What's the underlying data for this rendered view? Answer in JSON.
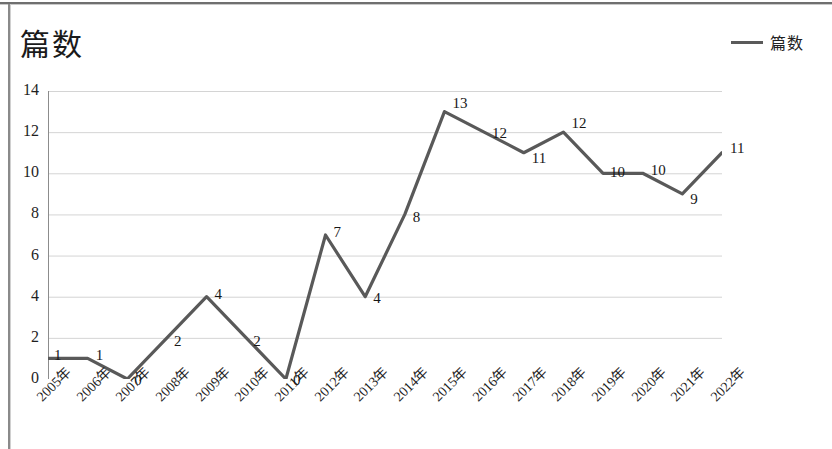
{
  "chart_data": {
    "type": "line",
    "title": "篇数",
    "xlabel": "",
    "ylabel": "",
    "ylim": [
      0,
      14
    ],
    "ytick_step": 2,
    "yticks": [
      "0",
      "2",
      "4",
      "6",
      "8",
      "10",
      "12",
      "14"
    ],
    "grid": true,
    "legend_position": "top-right",
    "legend": [
      "篇数"
    ],
    "line_color": "#595959",
    "categories": [
      "2005年",
      "2006年",
      "2007年",
      "2008年",
      "2009年",
      "2010年",
      "2011年",
      "2012年",
      "2013年",
      "2014年",
      "2015年",
      "2016年",
      "2017年",
      "2018年",
      "2019年",
      "2020年",
      "2021年",
      "2022年"
    ],
    "series": [
      {
        "name": "篇数",
        "values": [
          1,
          1,
          0,
          2,
          4,
          2,
          0,
          7,
          4,
          8,
          13,
          12,
          11,
          12,
          10,
          10,
          9,
          11
        ]
      }
    ],
    "data_labels": [
      "1",
      "1",
      "0",
      "2",
      "4",
      "2",
      "0",
      "7",
      "4",
      "8",
      "13",
      "12",
      "11",
      "12",
      "10",
      "10",
      "9",
      "11"
    ]
  }
}
